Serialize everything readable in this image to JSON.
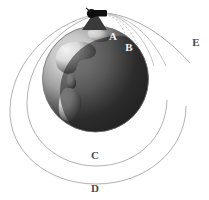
{
  "figure": {
    "background_color": "#ffffff",
    "width": 209,
    "height": 200
  },
  "globe": {
    "name": "Earth",
    "center_x": 95.5,
    "center_y": 79,
    "radius": 53,
    "lit_color": "#d9d9d9",
    "mid_color": "#9a9a9a",
    "shadow_color": "#2b2b2b",
    "outline_color": "#6e6e6e",
    "continents_visible": "Americas"
  },
  "cannon": {
    "label": "cannon",
    "color": "#141414",
    "mountain_color": "#3a3a3a",
    "muzzle_x": 104,
    "muzzle_y": 13,
    "breech_x": 90,
    "breech_y": 14
  },
  "labels": [
    {
      "id": "A",
      "text": "A",
      "x": 113,
      "y": 40,
      "color": "#f2f2f2",
      "describes": "shortest trajectory, falls to Earth"
    },
    {
      "id": "B",
      "text": "B",
      "x": 129,
      "y": 51,
      "color": "#f2f2f2",
      "describes": "longer trajectory, falls to Earth"
    },
    {
      "id": "C",
      "text": "C",
      "x": 95,
      "y": 159,
      "color": "#4a4a4a",
      "describes": "circular orbit"
    },
    {
      "id": "D",
      "text": "D",
      "x": 95,
      "y": 190,
      "color": "#4a4a4a",
      "describes": "larger elliptical orbit"
    },
    {
      "id": "E",
      "text": "E",
      "x": 196,
      "y": 46,
      "color": "#4a4a4a",
      "describes": "escape trajectory"
    }
  ],
  "trajectories": [
    {
      "id": "A",
      "type": "ballistic-short",
      "stroke": "#b5b5b5"
    },
    {
      "id": "B",
      "type": "ballistic-long",
      "stroke": "#b5b5b5"
    },
    {
      "id": "C",
      "type": "circular-orbit",
      "stroke": "#a8a8a8"
    },
    {
      "id": "D",
      "type": "elliptical-orbit",
      "stroke": "#a8a8a8"
    },
    {
      "id": "E",
      "type": "escape",
      "stroke": "#a8a8a8"
    }
  ]
}
